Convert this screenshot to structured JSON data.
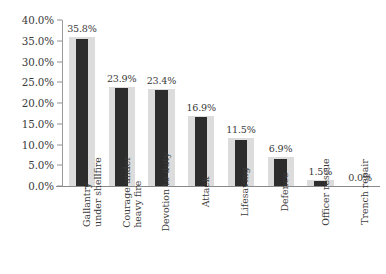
{
  "chart_data": {
    "type": "bar",
    "title": "",
    "subtitle": "",
    "xlabel": "",
    "ylabel": "",
    "ylim": [
      0,
      40
    ],
    "grid": false,
    "legend": false,
    "value_suffix": "%",
    "y_ticks": [
      "0.0%",
      "5.0%",
      "10.0%",
      "15.0%",
      "20.0%",
      "25.0%",
      "30.0%",
      "35.0%",
      "40.0%"
    ],
    "y_tick_values": [
      0,
      5,
      10,
      15,
      20,
      25,
      30,
      35,
      40
    ],
    "categories": [
      "Gallantry under shellfire",
      "Courage under heavy fire",
      "Devotion to duty",
      "Attack",
      "Lifesaving",
      "Defence",
      "Officer rescue",
      "Trench repair"
    ],
    "values": [
      35.8,
      23.9,
      23.4,
      16.9,
      11.5,
      6.9,
      1.5,
      0.0
    ],
    "data_labels": [
      "35.8%",
      "23.9%",
      "23.4%",
      "16.9%",
      "11.5%",
      "6.9%",
      "1.5%",
      "0.0%"
    ],
    "category_lines": [
      [
        "Gallantry",
        "under shellfire"
      ],
      [
        "Courage under",
        "heavy fire"
      ],
      [
        "Devotion to duty"
      ],
      [
        "Attack"
      ],
      [
        "Lifesaving"
      ],
      [
        "Defence"
      ],
      [
        "Officer rescue"
      ],
      [
        "Trench repair"
      ]
    ],
    "colors": {
      "bar_fill": "#2c2c2c",
      "bar_band": "#dcdcdc",
      "axis": "#8a8a8a",
      "text": "#3a3a3a",
      "background": "#ffffff"
    }
  }
}
